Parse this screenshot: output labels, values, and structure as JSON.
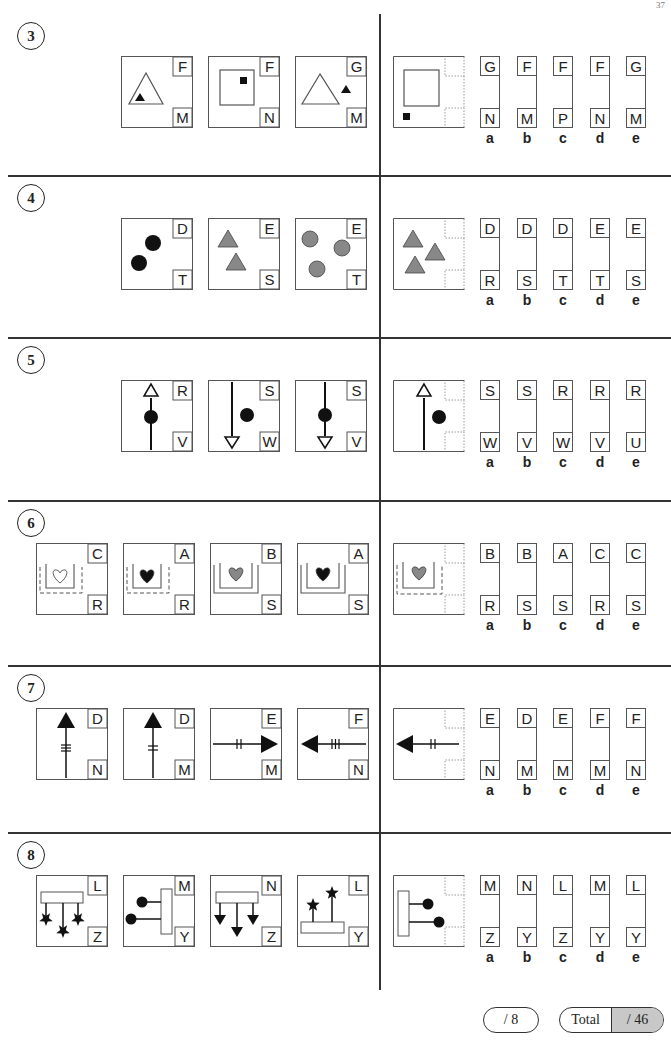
{
  "page": {
    "number_partial": "37"
  },
  "questions": [
    {
      "number": "3",
      "figures": [
        {
          "top": "F",
          "bottom": "M",
          "shape": "big-triangle-small-black-triangle-inside"
        },
        {
          "top": "F",
          "bottom": "N",
          "shape": "square-small-black-square-inside"
        },
        {
          "top": "G",
          "bottom": "M",
          "shape": "big-triangle-small-black-triangle-outside"
        }
      ],
      "question_figure": {
        "shape": "square-small-black-square-outside"
      },
      "options": [
        {
          "letter": "a",
          "top": "G",
          "bottom": "N"
        },
        {
          "letter": "b",
          "top": "F",
          "bottom": "M"
        },
        {
          "letter": "c",
          "top": "F",
          "bottom": "P"
        },
        {
          "letter": "d",
          "top": "F",
          "bottom": "N"
        },
        {
          "letter": "e",
          "top": "G",
          "bottom": "M"
        }
      ]
    },
    {
      "number": "4",
      "figures": [
        {
          "top": "D",
          "bottom": "T",
          "shape": "two-black-circles"
        },
        {
          "top": "E",
          "bottom": "S",
          "shape": "two-grey-triangles"
        },
        {
          "top": "E",
          "bottom": "T",
          "shape": "three-grey-circles"
        }
      ],
      "question_figure": {
        "shape": "three-grey-triangles"
      },
      "options": [
        {
          "letter": "a",
          "top": "D",
          "bottom": "R"
        },
        {
          "letter": "b",
          "top": "D",
          "bottom": "S"
        },
        {
          "letter": "c",
          "top": "D",
          "bottom": "T"
        },
        {
          "letter": "d",
          "top": "E",
          "bottom": "T"
        },
        {
          "letter": "e",
          "top": "E",
          "bottom": "S"
        }
      ]
    },
    {
      "number": "5",
      "figures": [
        {
          "top": "R",
          "bottom": "V",
          "shape": "up-arrow-dot-on-line"
        },
        {
          "top": "S",
          "bottom": "W",
          "shape": "down-arrow-dot-beside"
        },
        {
          "top": "S",
          "bottom": "V",
          "shape": "down-arrow-dot-on-line"
        }
      ],
      "question_figure": {
        "shape": "up-arrow-dot-beside"
      },
      "options": [
        {
          "letter": "a",
          "top": "S",
          "bottom": "W"
        },
        {
          "letter": "b",
          "top": "S",
          "bottom": "V"
        },
        {
          "letter": "c",
          "top": "R",
          "bottom": "W"
        },
        {
          "letter": "d",
          "top": "R",
          "bottom": "V"
        },
        {
          "letter": "e",
          "top": "R",
          "bottom": "U"
        }
      ]
    },
    {
      "number": "6",
      "figures": [
        {
          "top": "C",
          "bottom": "R",
          "shape": "white-heart-dashed-outer"
        },
        {
          "top": "A",
          "bottom": "R",
          "shape": "black-heart-dashed-outer"
        },
        {
          "top": "B",
          "bottom": "S",
          "shape": "grey-heart-solid-outer"
        },
        {
          "top": "A",
          "bottom": "S",
          "shape": "black-heart-solid-outer"
        }
      ],
      "question_figure": {
        "shape": "grey-heart-dashed-outer"
      },
      "options": [
        {
          "letter": "a",
          "top": "B",
          "bottom": "R"
        },
        {
          "letter": "b",
          "top": "B",
          "bottom": "S"
        },
        {
          "letter": "c",
          "top": "A",
          "bottom": "S"
        },
        {
          "letter": "d",
          "top": "C",
          "bottom": "R"
        },
        {
          "letter": "e",
          "top": "C",
          "bottom": "S"
        }
      ]
    },
    {
      "number": "7",
      "figures": [
        {
          "top": "D",
          "bottom": "N",
          "shape": "up-arrow-three-ticks"
        },
        {
          "top": "D",
          "bottom": "M",
          "shape": "up-arrow-two-ticks"
        },
        {
          "top": "E",
          "bottom": "M",
          "shape": "right-arrow-two-ticks"
        },
        {
          "top": "F",
          "bottom": "N",
          "shape": "left-arrow-three-ticks"
        }
      ],
      "question_figure": {
        "shape": "left-arrow-two-ticks"
      },
      "options": [
        {
          "letter": "a",
          "top": "E",
          "bottom": "N"
        },
        {
          "letter": "b",
          "top": "D",
          "bottom": "M"
        },
        {
          "letter": "c",
          "top": "E",
          "bottom": "M"
        },
        {
          "letter": "d",
          "top": "F",
          "bottom": "M"
        },
        {
          "letter": "e",
          "top": "F",
          "bottom": "N"
        }
      ]
    },
    {
      "number": "8",
      "figures": [
        {
          "top": "L",
          "bottom": "Z",
          "shape": "bar-three-stars-down"
        },
        {
          "top": "M",
          "bottom": "Y",
          "shape": "vertical-bar-two-dots-left"
        },
        {
          "top": "N",
          "bottom": "Z",
          "shape": "bar-three-arrows-down"
        },
        {
          "top": "L",
          "bottom": "Y",
          "shape": "bar-two-stars-up"
        }
      ],
      "question_figure": {
        "shape": "vertical-bar-two-dots-right"
      },
      "options": [
        {
          "letter": "a",
          "top": "M",
          "bottom": "Z"
        },
        {
          "letter": "b",
          "top": "N",
          "bottom": "Y"
        },
        {
          "letter": "c",
          "top": "L",
          "bottom": "Z"
        },
        {
          "letter": "d",
          "top": "M",
          "bottom": "Y"
        },
        {
          "letter": "e",
          "top": "L",
          "bottom": "Y"
        }
      ]
    }
  ],
  "score": {
    "section_score": "/ 8",
    "total_label": "Total",
    "total_score": "/ 46",
    "total_fill_color": "#c8c8c8"
  }
}
